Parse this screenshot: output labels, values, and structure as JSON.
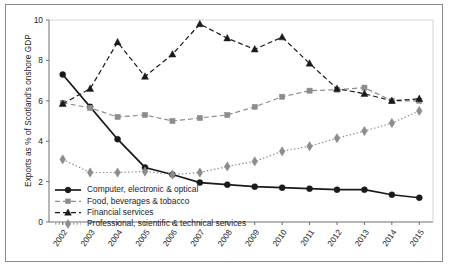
{
  "chart_data": {
    "type": "line",
    "title": "",
    "xlabel": "",
    "ylabel": "Exports as % of Scotland's onshore GDP",
    "ylim": [
      0,
      10
    ],
    "yticks": [
      0,
      2,
      4,
      6,
      8,
      10
    ],
    "ytick_labels": [
      "0",
      "2",
      "4",
      "6",
      "8",
      "10"
    ],
    "grid": false,
    "legend_position": "lower left inside",
    "categories": [
      "2002",
      "2003",
      "2004",
      "2005",
      "2006",
      "2007",
      "2008",
      "2009",
      "2010",
      "2011",
      "2012",
      "2013",
      "2014",
      "2015"
    ],
    "x": [
      "2002",
      "2003",
      "2004",
      "2005",
      "2006",
      "2007",
      "2008",
      "2009",
      "2010",
      "2011",
      "2012",
      "2013",
      "2014",
      "2015"
    ],
    "series": [
      {
        "name": "Computer, electronic & optical",
        "marker": "circle",
        "linestyle": "solid",
        "color": "#1a1a1a",
        "values": [
          7.3,
          5.7,
          4.1,
          2.7,
          2.35,
          1.95,
          1.85,
          1.75,
          1.7,
          1.65,
          1.6,
          1.6,
          1.35,
          1.2
        ]
      },
      {
        "name": "Food, beverages & tobacco",
        "marker": "square",
        "linestyle": "dashed",
        "color": "#8c8c8c",
        "values": [
          5.9,
          5.65,
          5.2,
          5.3,
          5.0,
          5.15,
          5.3,
          5.7,
          6.2,
          6.5,
          6.55,
          6.65,
          6.0,
          6.0
        ]
      },
      {
        "name": "Financial services",
        "marker": "triangle",
        "linestyle": "dashed",
        "color": "#1a1a1a",
        "values": [
          5.85,
          6.6,
          8.9,
          7.2,
          8.3,
          9.8,
          9.1,
          8.55,
          9.15,
          7.85,
          6.6,
          6.35,
          6.0,
          6.1
        ]
      },
      {
        "name": "Professional, scientific & technical services",
        "marker": "diamond",
        "linestyle": "dotted",
        "color": "#8c8c8c",
        "values": [
          3.1,
          2.45,
          2.45,
          2.5,
          2.35,
          2.45,
          2.75,
          3.0,
          3.5,
          3.75,
          4.15,
          4.5,
          4.9,
          5.5
        ]
      }
    ]
  },
  "legend": {
    "items": [
      {
        "label": "Computer, electronic & optical"
      },
      {
        "label": "Food, beverages & tobacco"
      },
      {
        "label": "Financial services"
      },
      {
        "label": "Professional, scientific & technical services"
      }
    ]
  }
}
